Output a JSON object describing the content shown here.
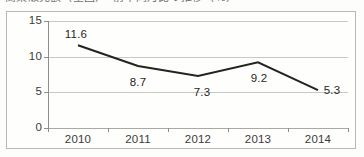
{
  "figure": {
    "title_partial": "商業販売額（全国）　前年同月比の推移（％）",
    "frame_color": "#b9b9b4",
    "background_color": "#fdfdfb"
  },
  "chart_data": {
    "type": "line",
    "title": "",
    "xlabel": "",
    "ylabel": "",
    "categories": [
      "2010",
      "2011",
      "2012",
      "2013",
      "2014"
    ],
    "values": [
      11.6,
      8.7,
      7.3,
      9.2,
      5.3
    ],
    "point_labels": [
      "11.6",
      "8.7",
      "7.3",
      "9.2",
      "5.3"
    ],
    "series": [
      {
        "name": "",
        "values": [
          11.6,
          8.7,
          7.3,
          9.2,
          5.3
        ]
      }
    ],
    "ylim": [
      0,
      15
    ],
    "yticks": [
      0,
      5,
      10,
      15
    ],
    "ytick_labels": [
      "0",
      "5",
      "10",
      "15"
    ],
    "grid": true,
    "grid_color": "#c9c9c4",
    "legend": "none",
    "line_color": "#23231f",
    "line_width": 2,
    "markers": "none"
  }
}
